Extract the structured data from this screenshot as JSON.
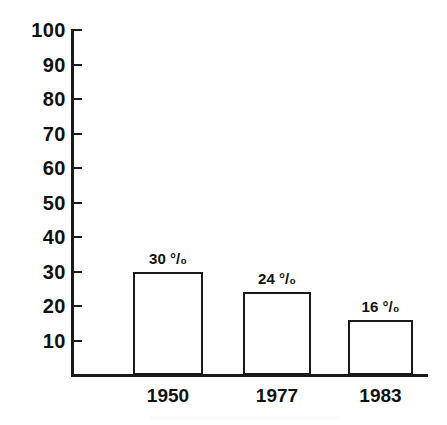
{
  "chart_data": {
    "type": "bar",
    "title": "",
    "subtitle": "",
    "xlabel": "",
    "ylabel": "",
    "categories": [
      "1950",
      "1977",
      "1983"
    ],
    "values": [
      30,
      24,
      16
    ],
    "data_labels": [
      "30 °/₀",
      "24 °/₀",
      "16 °/₀"
    ],
    "series": [
      {
        "name": "",
        "values": [
          30,
          24,
          16
        ]
      }
    ],
    "ylim": [
      0,
      100
    ],
    "y_ticks": [
      10,
      20,
      30,
      40,
      50,
      60,
      70,
      80,
      90,
      100
    ],
    "y_tick_labels": [
      "10",
      "20",
      "30",
      "40",
      "50",
      "60",
      "70",
      "80",
      "90",
      "100"
    ],
    "grid": false,
    "legend": "none",
    "bar_fill": "#ffffff",
    "bar_outline": "#1a1a1a",
    "axis_color": "#1a1a1a",
    "background": "#ffffff"
  },
  "axes": {
    "y": {
      "ticks": [
        {
          "label": "100",
          "value": 100
        },
        {
          "label": "90",
          "value": 90
        },
        {
          "label": "80",
          "value": 80
        },
        {
          "label": "70",
          "value": 70
        },
        {
          "label": "60",
          "value": 60
        },
        {
          "label": "50",
          "value": 50
        },
        {
          "label": "40",
          "value": 40
        },
        {
          "label": "30",
          "value": 30
        },
        {
          "label": "20",
          "value": 20
        },
        {
          "label": "10",
          "value": 10
        }
      ]
    },
    "x": {
      "ticks": [
        {
          "label": "1950"
        },
        {
          "label": "1977"
        },
        {
          "label": "1983"
        }
      ]
    }
  },
  "bars": [
    {
      "category": "1950",
      "value": 30,
      "label": "30 °/₀"
    },
    {
      "category": "1977",
      "value": 24,
      "label": "24 °/₀"
    },
    {
      "category": "1983",
      "value": 16,
      "label": "16 °/₀"
    }
  ]
}
